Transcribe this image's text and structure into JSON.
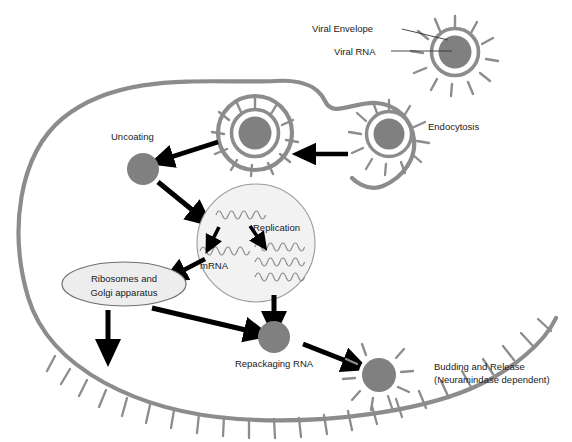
{
  "figure": {
    "background": "#ffffff"
  },
  "colors": {
    "membrane": "#8c8c8c",
    "virion_ring": "#8c8c8c",
    "virion_core": "#808080",
    "nucleus_fill": "#f2f2f2",
    "nucleus_stroke": "#999999",
    "organelle_fill": "#ededed",
    "organelle_stroke": "#6e6e6e",
    "rna_strand": "#8c8c8c",
    "arrow": "#000000",
    "leader_line": "#333333",
    "text": "#1a1a1a"
  },
  "labels": {
    "viral_envelope": "Viral Envelope",
    "viral_rna": "Viral RNA",
    "endocytosis": "Endocytosis",
    "uncoating": "Uncoating",
    "replication": "Replication",
    "mrna": "mRNA",
    "ribosomes_golgi_line1": "Ribosomes and",
    "ribosomes_golgi_line2": "Golgi apparatus",
    "repackaging_rna": "Repackaging RNA",
    "budding_line1": "Budding and Release",
    "budding_line2": "(Neuramindase dependent)"
  },
  "elements": {
    "free_virion": {
      "cx": 455,
      "cy": 52,
      "r_core": 17,
      "r_ring": 24,
      "spikes": 12
    },
    "endocytosed_virion": {
      "cx": 389,
      "cy": 134,
      "r_core": 16,
      "r_ring": 23,
      "spikes": 12
    },
    "vesicle_virion": {
      "cx": 255,
      "cy": 133,
      "r_core": 17,
      "r_ring": 24,
      "spikes": 12,
      "vesicle_r": 38
    },
    "uncoated_core": {
      "cx": 143,
      "cy": 169,
      "r": 16
    },
    "nucleus": {
      "cx": 256,
      "cy": 243,
      "r": 59
    },
    "organelle": {
      "cx": 124,
      "cy": 284,
      "rx": 62,
      "ry": 22
    },
    "repackaged_core": {
      "cx": 274,
      "cy": 337,
      "r": 16
    },
    "budding_virion": {
      "cx": 379,
      "cy": 375,
      "r_core": 17,
      "r_ring": 0,
      "spikes": 9
    }
  },
  "rna_strands": {
    "template": {
      "count": 1,
      "note": "single strand top-left of nucleus"
    },
    "mrna": {
      "count": 1,
      "note": "single strand lower-left of nucleus"
    },
    "replication": {
      "count": 3,
      "note": "three stacked strands right of nucleus"
    }
  }
}
